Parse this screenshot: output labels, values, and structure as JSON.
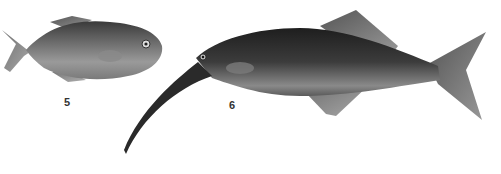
{
  "figure": {
    "figures": [
      {
        "number": "5",
        "subject": "deep-bodied small fish (pomfret-like), facing right"
      },
      {
        "number": "6",
        "subject": "elongated fish with long downcurved snout (elephantfish), facing left"
      }
    ],
    "colors": {
      "background": "#ffffff",
      "ink": "#2a2a2a"
    }
  }
}
